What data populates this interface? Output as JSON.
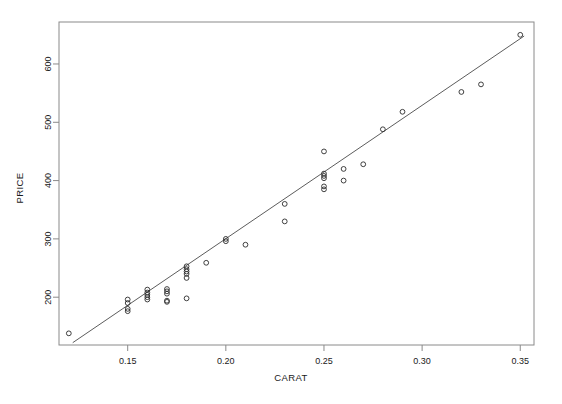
{
  "chart_data": {
    "type": "scatter",
    "title": "",
    "xlabel": "CARAT",
    "ylabel": "PRICE",
    "xlim": [
      0.115,
      0.357
    ],
    "ylim": [
      118,
      672
    ],
    "grid": false,
    "legend": "none",
    "xticks": [
      0.15,
      0.2,
      0.25,
      0.3,
      0.35
    ],
    "xtick_labels": [
      "0.15",
      "0.20",
      "0.25",
      "0.30",
      "0.35"
    ],
    "yticks": [
      200,
      300,
      400,
      500,
      600
    ],
    "ytick_labels": [
      "200",
      "300",
      "400",
      "500",
      "600"
    ],
    "marker": "open-circle",
    "points": [
      [
        0.12,
        138
      ],
      [
        0.15,
        196
      ],
      [
        0.15,
        190
      ],
      [
        0.15,
        180
      ],
      [
        0.15,
        176
      ],
      [
        0.16,
        213
      ],
      [
        0.16,
        208
      ],
      [
        0.16,
        204
      ],
      [
        0.16,
        200
      ],
      [
        0.16,
        196
      ],
      [
        0.17,
        214
      ],
      [
        0.17,
        210
      ],
      [
        0.17,
        206
      ],
      [
        0.17,
        194
      ],
      [
        0.17,
        192
      ],
      [
        0.18,
        198
      ],
      [
        0.18,
        253
      ],
      [
        0.18,
        248
      ],
      [
        0.18,
        244
      ],
      [
        0.18,
        240
      ],
      [
        0.18,
        233
      ],
      [
        0.19,
        259
      ],
      [
        0.2,
        300
      ],
      [
        0.2,
        296
      ],
      [
        0.21,
        290
      ],
      [
        0.23,
        360
      ],
      [
        0.23,
        330
      ],
      [
        0.25,
        450
      ],
      [
        0.25,
        412
      ],
      [
        0.25,
        408
      ],
      [
        0.25,
        404
      ],
      [
        0.25,
        390
      ],
      [
        0.25,
        385
      ],
      [
        0.26,
        420
      ],
      [
        0.26,
        400
      ],
      [
        0.27,
        428
      ],
      [
        0.28,
        488
      ],
      [
        0.29,
        518
      ],
      [
        0.32,
        552
      ],
      [
        0.33,
        565
      ],
      [
        0.35,
        650
      ]
    ],
    "fit_line": {
      "type": "linear-regression",
      "x_start": 0.122,
      "y_start": 122,
      "x_end": 0.352,
      "y_end": 648
    }
  },
  "axes": {
    "x_title": "CARAT",
    "y_title": "PRICE"
  },
  "colors": {
    "background": "#ffffff",
    "frame": "#8a8a8a",
    "marker": "#2b2b2b",
    "fit_line": "#4a4a4a",
    "text": "#1a1a1a"
  }
}
